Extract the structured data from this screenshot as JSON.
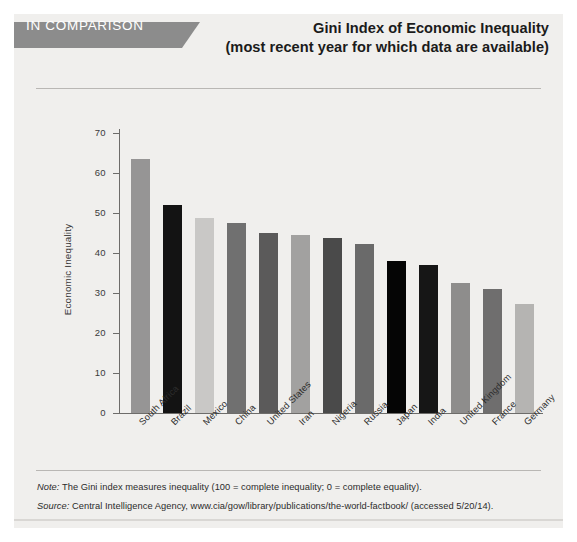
{
  "header": {
    "banner_label": "IN COMPARISON",
    "title_line_1": "Gini Index of Economic Inequality",
    "title_line_2": "(most recent year for which data are available)"
  },
  "footnotes": {
    "note_prefix": "Note:",
    "note_text": " The Gini index measures inequality (100 = complete inequality; 0 = complete equality).",
    "source_prefix": "Source:",
    "source_text": " Central Intelligence Agency, www.cia/gow/library/publications/the-world-factbook/ (accessed 5/20/14)."
  },
  "colors": {
    "panel_background": "#f0efed",
    "banner": "#8c8c8c",
    "axis": "#6d6c6a",
    "rule": "#b9b7b4",
    "text": "#2c2c2c"
  },
  "chart_data": {
    "type": "bar",
    "title": "Gini Index of Economic Inequality (most recent year for which data are available)",
    "xlabel": "",
    "ylabel": "Economic Inequality",
    "ylim": [
      0,
      70
    ],
    "yticks": [
      0,
      10,
      20,
      30,
      40,
      50,
      60,
      70
    ],
    "ytick_labels": [
      "0",
      "10",
      "20",
      "30",
      "40",
      "50",
      "60",
      "70"
    ],
    "grid": false,
    "legend": "none",
    "categories": [
      "South Africa",
      "Brazil",
      "Mexico",
      "China",
      "United States",
      "Iran",
      "Nigeria",
      "Russia",
      "Japan",
      "India",
      "United Kingdom",
      "France",
      "Germany"
    ],
    "values": [
      63.4,
      51.9,
      48.7,
      47.4,
      45.0,
      44.5,
      43.7,
      42.2,
      37.9,
      37.0,
      32.6,
      30.9,
      27.3
    ],
    "bar_colors": [
      "#969595",
      "#131313",
      "#c9c8c6",
      "#707070",
      "#5b5a5a",
      "#a2a1a0",
      "#4a4a4a",
      "#6a6a6a",
      "#050505",
      "#161616",
      "#8e8d8c",
      "#6f6e6e",
      "#b5b4b2"
    ]
  }
}
